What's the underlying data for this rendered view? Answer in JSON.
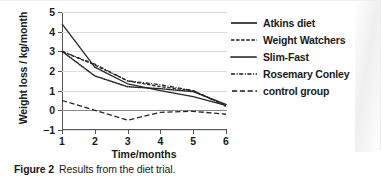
{
  "figure": {
    "caption_label": "Figure 2",
    "caption_text": "Results from the diet trial."
  },
  "chart_data": {
    "type": "line",
    "title": "",
    "xlabel": "Time/months",
    "ylabel": "Weight loss / kg/month",
    "xlim": [
      1,
      6
    ],
    "ylim": [
      -1,
      5
    ],
    "x_ticks": [
      1,
      2,
      3,
      4,
      5,
      6
    ],
    "y_ticks": [
      -1,
      0,
      1,
      2,
      3,
      4,
      5
    ],
    "grid": "horizontal",
    "zero_line": true,
    "legend_position": "right",
    "x": [
      1,
      2,
      3,
      4,
      5,
      6
    ],
    "series": [
      {
        "name": "Atkins diet",
        "dash": "solid",
        "color": "#262626",
        "values": [
          4.4,
          2.2,
          1.35,
          1.0,
          0.7,
          0.25
        ]
      },
      {
        "name": "Weight Watchers",
        "dash": "dashed",
        "color": "#262626",
        "values": [
          3.0,
          2.3,
          1.5,
          1.2,
          1.0,
          0.25
        ]
      },
      {
        "name": "Slim-Fast",
        "dash": "dotted",
        "color": "#262626",
        "values": [
          3.0,
          1.75,
          1.2,
          1.1,
          0.95,
          0.3
        ]
      },
      {
        "name": "Rosemary Conley",
        "dash": "dash-dot",
        "color": "#262626",
        "values": [
          3.0,
          2.35,
          1.5,
          1.3,
          1.0,
          0.2
        ]
      },
      {
        "name": "control group",
        "dash": "long-dash",
        "color": "#262626",
        "values": [
          0.5,
          0.0,
          -0.5,
          -0.1,
          -0.05,
          -0.2
        ]
      }
    ]
  },
  "legend": {
    "items": [
      {
        "label": "Atkins diet",
        "dash": "solid"
      },
      {
        "label": "Weight Watchers",
        "dash": "dashed"
      },
      {
        "label": "Slim-Fast",
        "dash": "dotted"
      },
      {
        "label": "Rosemary Conley",
        "dash": "dash-dot"
      },
      {
        "label": "control group",
        "dash": "long-dash"
      }
    ]
  }
}
